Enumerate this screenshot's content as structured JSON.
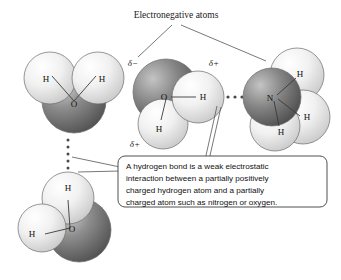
{
  "figure": {
    "title_label": "Electronegative atoms",
    "background_color": "#ffffff"
  },
  "callout": {
    "lines": [
      "A hydrogen bond is a weak electrostatic",
      "interaction between a partially positively",
      "charged hydrogen atom and a partially",
      "charged atom such as nitrogen or oxygen."
    ],
    "border_color": "#3c3c3c",
    "fill_color": "#ffffff"
  },
  "molecules": [
    {
      "id": "water-top-left",
      "formula": "H2O",
      "atom_labels": {
        "oxygen": "O",
        "hydrogen_left": "H",
        "hydrogen_right": "H"
      }
    },
    {
      "id": "water-bottom-left",
      "formula": "H2O",
      "atom_labels": {
        "oxygen": "O",
        "hydrogen_top": "H",
        "hydrogen_left": "H"
      }
    },
    {
      "id": "water-center",
      "formula": "H2O",
      "atom_labels": {
        "oxygen": "O",
        "hydrogen_right": "H",
        "hydrogen_bottom": "H"
      },
      "charge_labels": {
        "oxygen": "δ−",
        "hydrogen_right": "δ+",
        "hydrogen_bottom": "δ+"
      }
    },
    {
      "id": "ammonia-right",
      "formula": "NH3",
      "atom_labels": {
        "nitrogen": "N",
        "hydrogen_top": "H",
        "hydrogen_right": "H",
        "hydrogen_bottom": "H"
      }
    }
  ],
  "hydrogen_bonds": [
    {
      "id": "hbond-vertical-left",
      "orientation": "vertical",
      "dot_count": 6
    },
    {
      "id": "hbond-horizontal-center",
      "orientation": "horizontal",
      "dot_count": 5
    }
  ],
  "colors": {
    "electronegative_atom_dark": "#6e6e6e",
    "hydrogen_light": "#e9e9e9",
    "outline": "#6b6b6b",
    "text": "#111111"
  }
}
